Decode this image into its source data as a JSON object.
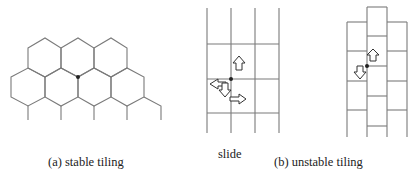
{
  "captions": {
    "a": "(a) stable tiling",
    "slide": "slide",
    "b": "(b) unstable tiling"
  },
  "colors": {
    "line": "#7a7a7a",
    "dot": "#222222",
    "arrow_fill": "#ffffff",
    "arrow_stroke": "#333333"
  },
  "panels": [
    {
      "id": "a",
      "type": "hexagonal-tiling",
      "marked_vertex": true
    },
    {
      "id": "b-grid",
      "type": "square-grid",
      "columns": 3,
      "arrows": [
        "up",
        "left",
        "down",
        "right"
      ]
    },
    {
      "id": "b-brick",
      "type": "offset-brick-grid",
      "columns": 3,
      "arrows": [
        "up",
        "down"
      ]
    }
  ]
}
